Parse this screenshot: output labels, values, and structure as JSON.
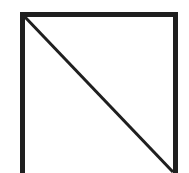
{
  "canvas": {
    "width": 189,
    "height": 173,
    "background_color": "#ffffff",
    "title": "Square outline with diagonal"
  },
  "figure": {
    "name": "square-with-diagonal",
    "stroke_color": "#1f1f1f",
    "fill_color": "#ffffff",
    "frame_stroke_width": 5,
    "diagonal_stroke_width": 3,
    "frame": {
      "left_x": 22.5,
      "right_x": 175.5,
      "top_y": 14.5,
      "bottom_y": 173
    },
    "diagonal": {
      "x1": 24,
      "y1": 16,
      "x2": 173,
      "y2": 172
    }
  },
  "labels": {
    "top_edge": "top edge",
    "left_edge": "left edge",
    "right_edge": "right edge",
    "diagonal_line": "diagonal"
  }
}
